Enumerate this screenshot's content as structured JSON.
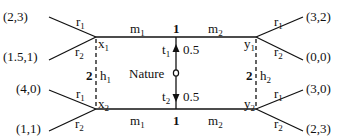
{
  "diagram": {
    "type": "signaling-game-tree",
    "nature": {
      "label": "Nature",
      "moves": [
        {
          "type": "t1",
          "label": "t",
          "sub": "1",
          "prob": "0.5"
        },
        {
          "type": "t2",
          "label": "t",
          "sub": "2",
          "prob": "0.5"
        }
      ]
    },
    "player1": {
      "label": "1",
      "messages_top": [
        {
          "label": "m",
          "sub": "1"
        },
        {
          "label": "m",
          "sub": "2"
        }
      ],
      "messages_bottom": [
        {
          "label": "m",
          "sub": "1"
        },
        {
          "label": "m",
          "sub": "2"
        }
      ]
    },
    "player2": {
      "label": "2",
      "info_sets": [
        {
          "label": "h",
          "sub": "1",
          "nodes": [
            {
              "label": "x",
              "sub": "1"
            },
            {
              "label": "x",
              "sub": "2"
            }
          ]
        },
        {
          "label": "h",
          "sub": "2",
          "nodes": [
            {
              "label": "y",
              "sub": "1"
            },
            {
              "label": "y",
              "sub": "2"
            }
          ]
        }
      ],
      "responses": [
        {
          "label": "r",
          "sub": "1"
        },
        {
          "label": "r",
          "sub": "2"
        }
      ]
    },
    "payoffs": {
      "x1": {
        "r1": "(2,3)",
        "r2": "(1.5,1)"
      },
      "x2": {
        "r1": "(4,0)",
        "r2": "(1,1)"
      },
      "y1": {
        "r1": "(3,2)",
        "r2": "(0,0)"
      },
      "y2": {
        "r1": "(3,0)",
        "r2": "(2,3)"
      }
    }
  }
}
